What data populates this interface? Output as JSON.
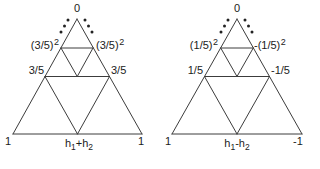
{
  "figure": {
    "background": "#ffffff",
    "line_color": "#3c3c3c",
    "dot_color": "#222222",
    "text_color": "#1b1b1b"
  },
  "left": {
    "apex": "0",
    "level2_left": {
      "base": "(3/5)",
      "sup": "2"
    },
    "level2_right": {
      "base": "(3/5)",
      "sup": "2"
    },
    "level1_left": "3/5",
    "level1_right": "3/5",
    "corner_left": "1",
    "corner_right": "1",
    "bottom": {
      "p1": "h",
      "s1": "1",
      "p2": "+h",
      "s2": "2"
    }
  },
  "right": {
    "apex": "0",
    "level2_left": {
      "base": "(1/5)",
      "sup": "2"
    },
    "level2_right": {
      "base": "-(1/5)",
      "sup": "2"
    },
    "level1_left": "1/5",
    "level1_right": "-1/5",
    "corner_left": "1",
    "corner_right": "-1",
    "bottom": {
      "p1": "h",
      "s1": "1",
      "p2": "-h",
      "s2": "2"
    }
  }
}
